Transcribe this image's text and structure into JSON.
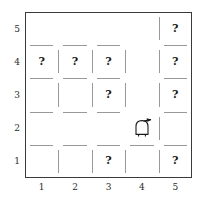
{
  "figure": {
    "type": "grid-maze",
    "name": "robot-gridworld-map",
    "grid": {
      "cols": 5,
      "rows": 5
    },
    "frame_color": "#3a3a3a",
    "wall_color": "#999999",
    "background": "#ffffff"
  },
  "axes": {
    "x_ticks": [
      "1",
      "2",
      "3",
      "4",
      "5"
    ],
    "y_ticks": [
      "5",
      "4",
      "3",
      "2",
      "1"
    ]
  },
  "cells": {
    "unknown_marker": "?",
    "unknown_cells": [
      {
        "x": 1,
        "y": 4,
        "label": "?"
      },
      {
        "x": 2,
        "y": 4,
        "label": "?"
      },
      {
        "x": 3,
        "y": 4,
        "label": "?"
      },
      {
        "x": 3,
        "y": 3,
        "label": "?"
      },
      {
        "x": 3,
        "y": 1,
        "label": "?"
      },
      {
        "x": 5,
        "y": 5,
        "label": "?"
      },
      {
        "x": 5,
        "y": 4,
        "label": "?"
      },
      {
        "x": 5,
        "y": 3,
        "label": "?"
      },
      {
        "x": 5,
        "y": 1,
        "label": "?"
      }
    ]
  },
  "robot": {
    "name": "robot-agent",
    "cell_x": 4,
    "cell_y": 2,
    "heading": "east",
    "body_color": "#ffffff",
    "outline_color": "#1a1a1a"
  },
  "walls": {
    "horizontal": [
      {
        "col": 1,
        "edge_y": 4.5
      },
      {
        "col": 2,
        "edge_y": 4.5
      },
      {
        "col": 3,
        "edge_y": 4.5
      },
      {
        "col": 5,
        "edge_y": 4.5
      },
      {
        "col": 1,
        "edge_y": 3.5
      },
      {
        "col": 2,
        "edge_y": 3.5
      },
      {
        "col": 3,
        "edge_y": 3.5
      },
      {
        "col": 5,
        "edge_y": 3.5
      },
      {
        "col": 1,
        "edge_y": 2.5
      },
      {
        "col": 2,
        "edge_y": 2.5
      },
      {
        "col": 3,
        "edge_y": 2.5
      },
      {
        "col": 5,
        "edge_y": 2.5
      },
      {
        "col": 1,
        "edge_y": 1.5
      },
      {
        "col": 2,
        "edge_y": 1.5
      },
      {
        "col": 3,
        "edge_y": 1.5
      },
      {
        "col": 4,
        "edge_y": 1.5
      },
      {
        "col": 5,
        "edge_y": 1.5
      }
    ],
    "vertical": [
      {
        "row": 4,
        "edge_x": 1.5
      },
      {
        "row": 4,
        "edge_x": 2.5
      },
      {
        "row": 4,
        "edge_x": 3.5
      },
      {
        "row": 3,
        "edge_x": 1.5
      },
      {
        "row": 3,
        "edge_x": 2.5
      },
      {
        "row": 3,
        "edge_x": 3.5
      },
      {
        "row": 5,
        "edge_x": 4.5
      },
      {
        "row": 4,
        "edge_x": 4.5
      },
      {
        "row": 3,
        "edge_x": 4.5
      },
      {
        "row": 2,
        "edge_x": 4.5
      },
      {
        "row": 1,
        "edge_x": 1.5
      },
      {
        "row": 1,
        "edge_x": 2.5
      },
      {
        "row": 1,
        "edge_x": 3.5
      },
      {
        "row": 1,
        "edge_x": 4.5
      }
    ]
  }
}
